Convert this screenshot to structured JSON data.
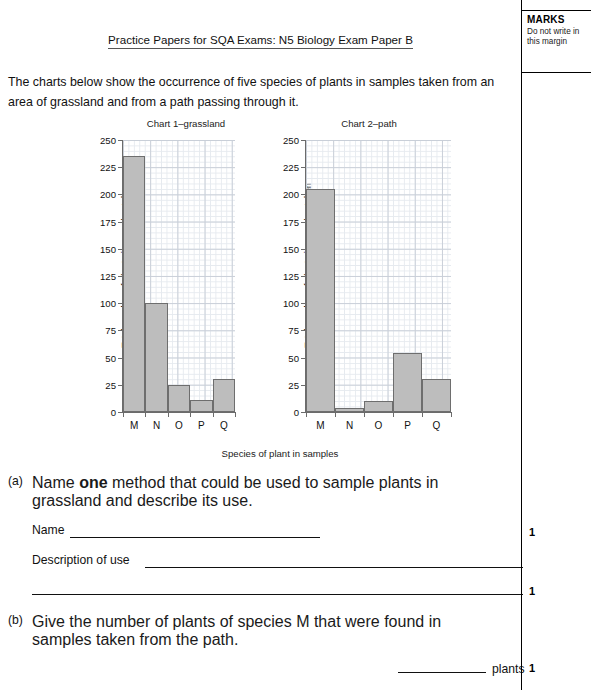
{
  "header": {
    "title": "Practice Papers for SQA Exams: N5 Biology Exam Paper B"
  },
  "marks_margin": {
    "title": "MARKS",
    "note": "Do not write in this margin",
    "values": [
      "1",
      "1",
      "1"
    ]
  },
  "intro": "The charts below show the occurrence of five species of plants in samples taken from an area of grassland and from a path passing through it.",
  "axis_label_x": "Species of plant in samples",
  "questions": [
    {
      "number": "(a)",
      "text_before_bold": "Name ",
      "bold": "one",
      "text_after_bold": " method that could be used to sample plants in grassland and describe its use.",
      "fields": [
        {
          "label": "Name"
        },
        {
          "label": "Description of use"
        }
      ],
      "mark": "1"
    },
    {
      "number": "(b)",
      "text": "Give the number of plants of species M that were found in samples taken from the path.",
      "answer_unit": "plants",
      "mark": "1"
    }
  ],
  "chart_data": [
    {
      "type": "bar",
      "title": "Chart 1–grassland",
      "categories": [
        "M",
        "N",
        "O",
        "P",
        "Q"
      ],
      "values": [
        235,
        100,
        25,
        11,
        30
      ],
      "xlabel": "Species of plant in samples",
      "ylabel": "Total number of plants in samples taken",
      "ylim": [
        0,
        250
      ],
      "yticks": [
        0,
        25,
        50,
        75,
        100,
        125,
        150,
        175,
        200,
        225,
        250
      ],
      "grid": true,
      "bar_fill": "#bdbdbd",
      "bar_stroke": "#6e6e6e",
      "legend": "none"
    },
    {
      "type": "bar",
      "title": "Chart 2–path",
      "categories": [
        "M",
        "N",
        "O",
        "P",
        "Q"
      ],
      "values": [
        205,
        4,
        10,
        54,
        30
      ],
      "xlabel": "Species of plant in samples",
      "ylabel": "Total number of plants in samples taken",
      "ylim": [
        0,
        250
      ],
      "yticks": [
        0,
        25,
        50,
        75,
        100,
        125,
        150,
        175,
        200,
        225,
        250
      ],
      "grid": true,
      "bar_fill": "#bdbdbd",
      "bar_stroke": "#6e6e6e",
      "legend": "none"
    }
  ]
}
